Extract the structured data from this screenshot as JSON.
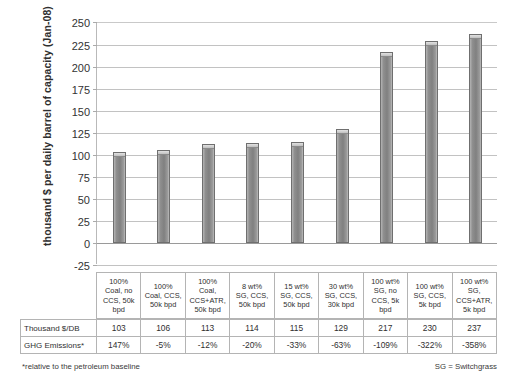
{
  "chart_data": {
    "type": "bar",
    "title": "",
    "xlabel": "",
    "ylabel": "thousand $ per daily barrel of capacity (Jan-08)",
    "ylim": [
      -25,
      250
    ],
    "ytick_step": 25,
    "grid": true,
    "legend": "none",
    "categories": [
      "100% Coal, no CCS, 50k bpd",
      "100% Coal, CCS, 50k bpd",
      "100% Coal, CCS+ATR, 50k bpd",
      "8 wt% SG, CCS, 50k bpd",
      "15 wt% SG, CCS, 50k bpd",
      "30 wt% SG, CCS, 30k bpd",
      "100 wt% SG, no CCS, 5k bpd",
      "100 wt% SG, CCS, 5k bpd",
      "100 wt% SG, CCS+ATR, 5k bpd"
    ],
    "values": [
      103,
      106,
      113,
      114,
      115,
      129,
      217,
      230,
      237
    ],
    "yticks": [
      "250",
      "225",
      "200",
      "175",
      "150",
      "125",
      "100",
      "75",
      "50",
      "25",
      "0",
      "-25"
    ],
    "bar_color": "#8f8f8f"
  },
  "category_labels": [
    [
      "100%",
      "Coal, no",
      "CCS, 50k",
      "bpd"
    ],
    [
      "100%",
      "Coal, CCS,",
      "50k bpd"
    ],
    [
      "100%",
      "Coal,",
      "CCS+ATR,",
      "50k bpd"
    ],
    [
      "8 wt%",
      "SG, CCS,",
      "50k bpd"
    ],
    [
      "15 wt%",
      "SG, CCS,",
      "50k bpd"
    ],
    [
      "30 wt%",
      "SG, CCS,",
      "30k bpd"
    ],
    [
      "100 wt%",
      "SG, no",
      "CCS, 5k",
      "bpd"
    ],
    [
      "100 wt%",
      "SG, CCS,",
      "5k bpd"
    ],
    [
      "100 wt%",
      "SG,",
      "CCS+ATR,",
      "5k bpd"
    ]
  ],
  "table": {
    "rows": [
      {
        "label": "Thousand $/DB",
        "values": [
          "103",
          "106",
          "113",
          "114",
          "115",
          "129",
          "217",
          "230",
          "237"
        ]
      },
      {
        "label": "GHG Emissions*",
        "values": [
          "147%",
          "-5%",
          "-12%",
          "-20%",
          "-33%",
          "-63%",
          "-109%",
          "-322%",
          "-358%"
        ]
      }
    ]
  },
  "footnotes": {
    "left": "*relative to the petroleum baseline",
    "right": "SG = Switchgrass"
  }
}
